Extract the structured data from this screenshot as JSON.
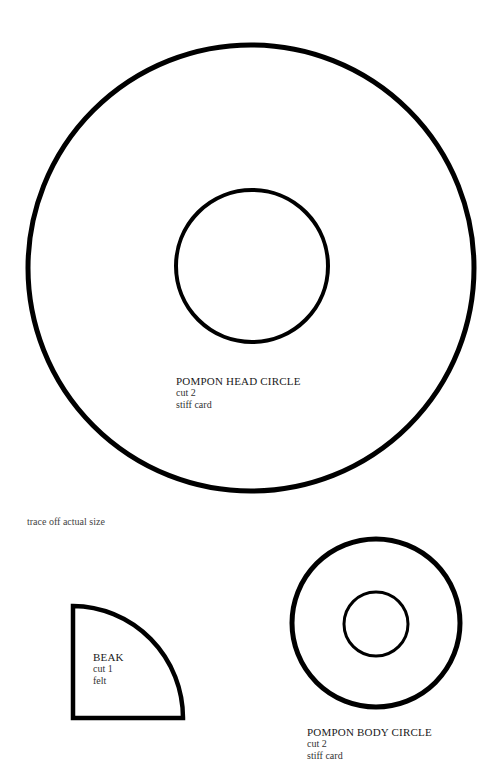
{
  "note": "trace off actual size",
  "pieces": {
    "head": {
      "title": "POMPON HEAD CIRCLE",
      "line1": "cut 2",
      "line2": "stiff card"
    },
    "beak": {
      "title": "BEAK",
      "line1": "cut 1",
      "line2": "felt"
    },
    "body": {
      "title": "POMPON BODY CIRCLE",
      "line1": "cut 2",
      "line2": "stiff card"
    }
  },
  "colors": {
    "stroke": "#000000",
    "background": "#ffffff"
  }
}
